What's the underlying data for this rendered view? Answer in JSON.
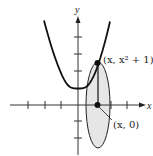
{
  "figure": {
    "curve_equation": "y = x^2 + 1",
    "axes": {
      "x_label": "x",
      "y_label": "y"
    },
    "points": {
      "top": {
        "label": "(x, x² + 1)"
      },
      "bottom": {
        "label": "(x, 0)"
      }
    },
    "colors": {
      "stroke": "#111111",
      "ellipse_fill": "#e6e6e6"
    },
    "ticks": {
      "x": [
        -3,
        -2,
        -1,
        1,
        2
      ],
      "y": [
        -2,
        -1,
        1,
        2,
        3,
        4
      ]
    }
  }
}
